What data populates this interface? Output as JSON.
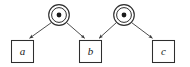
{
  "diagram": {
    "title": "",
    "type": "event-transition-diagram",
    "colors": {
      "background": "#ffffff",
      "stroke": "#3a3a3a",
      "box_fill": "#ffffff",
      "circle_fill": "#ffffff",
      "dot_fill": "#1a1a1a",
      "label": "#1a1a1a"
    },
    "circle_nodes": [
      {
        "id": "circle-node-1",
        "icon": "dot-in-circle-icon",
        "cx": 59,
        "cy": 15,
        "r_outer": 10.5,
        "r_inner": 7.5,
        "r_dot": 2.4
      },
      {
        "id": "circle-node-2",
        "icon": "dot-in-circle-icon",
        "cx": 124,
        "cy": 15,
        "r_outer": 10.5,
        "r_inner": 7.5,
        "r_dot": 2.4
      }
    ],
    "box_nodes": [
      {
        "id": "box-node-a",
        "label": "a",
        "x": 11,
        "y": 40,
        "w": 22,
        "h": 22
      },
      {
        "id": "box-node-b",
        "label": "b",
        "x": 79,
        "y": 40,
        "w": 22,
        "h": 22
      },
      {
        "id": "box-node-c",
        "label": "c",
        "x": 152,
        "y": 40,
        "w": 22,
        "h": 22
      }
    ],
    "edges": [
      {
        "id": "edge-circle1-to-a",
        "from": "circle-node-1",
        "to": "box-node-a",
        "x1": 51.5,
        "y1": 22.5,
        "x2": 29,
        "y2": 38.5
      },
      {
        "id": "edge-circle1-to-b",
        "from": "circle-node-1",
        "to": "box-node-b",
        "x1": 66.5,
        "y1": 22.5,
        "x2": 85,
        "y2": 38.5
      },
      {
        "id": "edge-circle2-to-b",
        "from": "circle-node-2",
        "to": "box-node-b",
        "x1": 116.5,
        "y1": 22.5,
        "x2": 99,
        "y2": 38.5
      },
      {
        "id": "edge-circle2-to-c",
        "from": "circle-node-2",
        "to": "box-node-c",
        "x1": 131.5,
        "y1": 22.5,
        "x2": 152,
        "y2": 38.5
      }
    ]
  }
}
